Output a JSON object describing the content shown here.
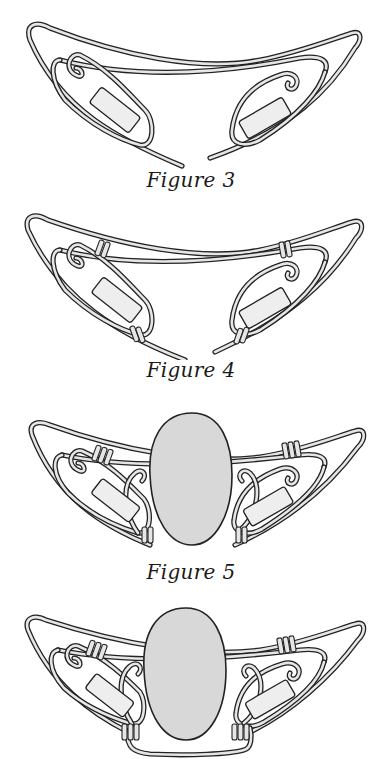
{
  "figures": [
    {
      "id": "figure-3",
      "caption": "Figure 3",
      "description": "Two wire swirl wings joined by a top wire, each holding a tube bead, ends open"
    },
    {
      "id": "figure-4",
      "caption": "Figure 4",
      "description": "Wire wings wrapped with coils at top joins and lower ends"
    },
    {
      "id": "figure-5",
      "caption": "Figure 5",
      "description": "Oval stone placed between the wings, coils and extra spirals added"
    },
    {
      "id": "figure-6",
      "caption": "",
      "description": "Completed setting with bottom wire bail wrapping beneath the stone"
    }
  ],
  "colors": {
    "background": "#ffffff",
    "wire_outline": "#222222",
    "wire_fill": "#e6e6e6",
    "stone_fill": "#d8d8d8",
    "bead_fill": "#eeeeee"
  }
}
